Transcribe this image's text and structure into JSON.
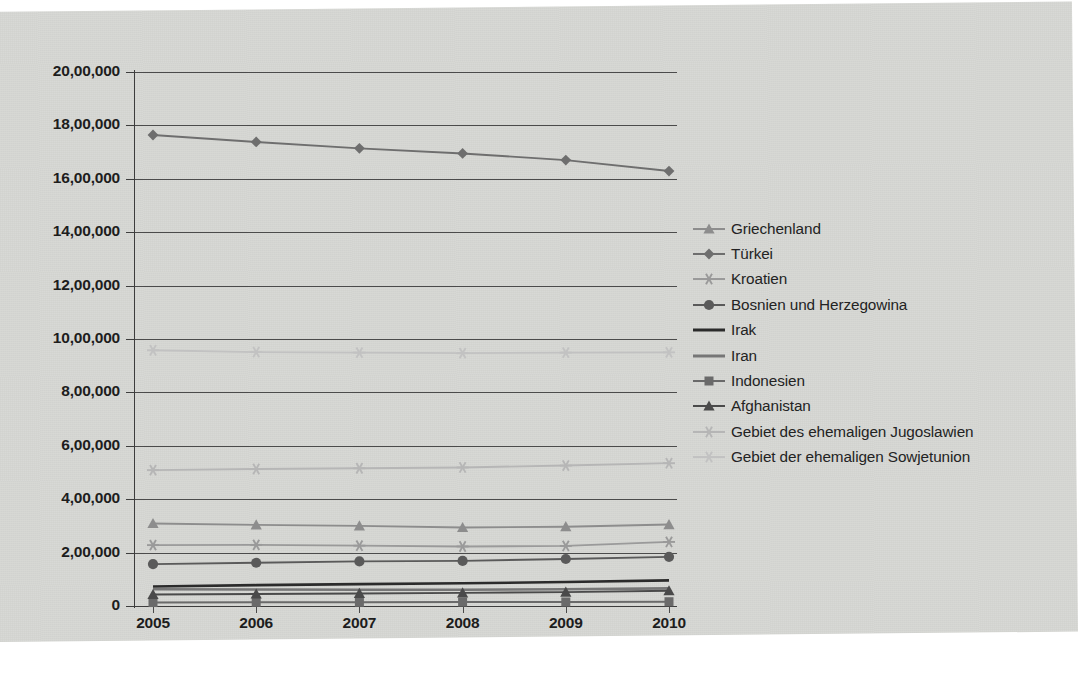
{
  "chart_data": {
    "type": "line",
    "title": "",
    "subtitle": "",
    "xlabel": "",
    "ylabel": "",
    "x": [
      2005,
      2006,
      2007,
      2008,
      2009,
      2010
    ],
    "categories": [
      "2005",
      "2006",
      "2007",
      "2008",
      "2009",
      "2010"
    ],
    "xtick_labels": [
      "2005",
      "2006",
      "2007",
      "2008",
      "2009",
      "2010"
    ],
    "ytick_labels": [
      "0",
      "2,00,000",
      "4,00,000",
      "6,00,000",
      "8,00,000",
      "10,00,000",
      "12,00,000",
      "14,00,000",
      "16,00,000",
      "18,00,000",
      "20,00,000"
    ],
    "ytick_values": [
      0,
      200000,
      400000,
      600000,
      800000,
      1000000,
      1200000,
      1400000,
      1600000,
      1800000,
      2000000
    ],
    "ylim": [
      0,
      2000000
    ],
    "xlim": [
      2005,
      2010
    ],
    "grid": "horizontal",
    "legend_position": "right",
    "series": [
      {
        "name": "Griechenland",
        "marker": "triangle",
        "color": "#8d8d8d",
        "values": [
          309000,
          304000,
          300000,
          294000,
          297000,
          305000
        ]
      },
      {
        "name": "Türkei",
        "marker": "diamond",
        "color": "#6e6e6e",
        "values": [
          1764000,
          1738000,
          1714000,
          1695000,
          1670000,
          1629000
        ]
      },
      {
        "name": "Kroatien",
        "marker": "star",
        "color": "#9a9a9a",
        "values": [
          228000,
          229000,
          226000,
          223000,
          225000,
          240000
        ]
      },
      {
        "name": "Bosnien und Herzegowina",
        "marker": "circle",
        "color": "#5a5a5a",
        "values": [
          157000,
          162000,
          167000,
          169000,
          176000,
          184000
        ]
      },
      {
        "name": "Irak",
        "marker": "none",
        "color": "#2b2b2b",
        "values": [
          73000,
          78000,
          82000,
          85000,
          90000,
          96000
        ]
      },
      {
        "name": "Iran",
        "marker": "none",
        "color": "#767676",
        "values": [
          63000,
          62000,
          61000,
          61000,
          63000,
          66000
        ]
      },
      {
        "name": "Indonesien",
        "marker": "square",
        "color": "#6a6a6a",
        "values": [
          13000,
          14000,
          14000,
          15000,
          15000,
          16000
        ]
      },
      {
        "name": "Afghanistan",
        "marker": "triangle",
        "color": "#4a4a4a",
        "values": [
          43000,
          45000,
          47000,
          49000,
          52000,
          57000
        ]
      },
      {
        "name": "Gebiet des ehemaligen Jugoslawien",
        "marker": "star",
        "color": "#b6b6b6",
        "values": [
          509000,
          513000,
          516000,
          519000,
          526000,
          535000
        ]
      },
      {
        "name": "Gebiet der ehemaligen Sowjetunion",
        "marker": "star",
        "color": "#c2c2c2",
        "values": [
          958000,
          951000,
          949000,
          947000,
          949000,
          950000
        ]
      }
    ]
  },
  "legend": {
    "items": [
      {
        "label": "Griechenland"
      },
      {
        "label": "Türkei"
      },
      {
        "label": "Kroatien"
      },
      {
        "label": "Bosnien und Herzegowina"
      },
      {
        "label": "Irak"
      },
      {
        "label": "Iran"
      },
      {
        "label": "Indonesien"
      },
      {
        "label": "Afghanistan"
      },
      {
        "label": "Gebiet des ehemaligen Jugoslawien"
      },
      {
        "label": "Gebiet der ehemaligen Sowjetunion"
      }
    ]
  },
  "page": {
    "background_color": "#d7d8d4",
    "axis_color": "#3d3d3d",
    "gridline_color": "#4b4b4b",
    "text_color": "#1d1d1d"
  }
}
